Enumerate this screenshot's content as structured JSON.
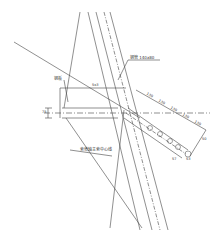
{
  "drawing": {
    "labels": {
      "steel_pipe": "钢管 140x80",
      "steel_plate": "钢板",
      "centerline": "索塔轴主索中心线",
      "top_dim": "5x3"
    },
    "dimensions": {
      "left_vertical": "75",
      "diag_1": "130",
      "diag_2": "130",
      "diag_3": "130",
      "diag_4": "130",
      "diag_5": "130",
      "end_1": "50",
      "end_2": "57",
      "end_3": "53"
    },
    "colors": {
      "line": "#333333",
      "background": "#ffffff"
    }
  }
}
